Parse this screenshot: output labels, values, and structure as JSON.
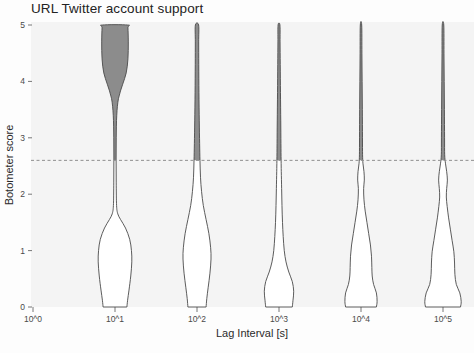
{
  "title": "URL Twitter account support",
  "chart_data": {
    "type": "violin",
    "title": "URL Twitter account support",
    "xlabel": "Lag Interval [s]",
    "ylabel": "Botometer score",
    "grid": false,
    "legend": null,
    "ylim": [
      0,
      5
    ],
    "xlim_log_exponents": [
      0,
      5
    ],
    "y_ticks": [
      "0",
      "1",
      "2",
      "3",
      "4",
      "5"
    ],
    "y_tick_values": [
      0,
      1,
      2,
      3,
      4,
      5
    ],
    "x_ticks": [
      "10^0",
      "10^1",
      "10^2",
      "10^3",
      "10^4",
      "10^5"
    ],
    "x_tick_exponents": [
      0,
      1,
      2,
      3,
      4,
      5
    ],
    "threshold": {
      "value": 2.6,
      "style": "dashed",
      "color": "#8f8f8f",
      "label": "bot threshold"
    },
    "colors": {
      "fill_above_threshold": "#8c8c8c",
      "fill_below_threshold": "#ffffff",
      "outline": "#4a4a4a",
      "panel_background": "#f4f4f4",
      "text": "#2b2b2b"
    },
    "categories": [
      "10^1",
      "10^2",
      "10^3",
      "10^4",
      "10^5"
    ],
    "series": [
      {
        "name": "10^1",
        "center_exponent": 1,
        "kde": [
          {
            "y": 0.0,
            "w": 0.34
          },
          {
            "y": 0.12,
            "w": 0.36
          },
          {
            "y": 0.3,
            "w": 0.4
          },
          {
            "y": 0.55,
            "w": 0.45
          },
          {
            "y": 0.8,
            "w": 0.48
          },
          {
            "y": 1.0,
            "w": 0.47
          },
          {
            "y": 1.2,
            "w": 0.42
          },
          {
            "y": 1.4,
            "w": 0.3
          },
          {
            "y": 1.55,
            "w": 0.16
          },
          {
            "y": 1.65,
            "w": 0.08
          },
          {
            "y": 1.8,
            "w": 0.045
          },
          {
            "y": 2.2,
            "w": 0.035
          },
          {
            "y": 2.6,
            "w": 0.032
          },
          {
            "y": 3.0,
            "w": 0.035
          },
          {
            "y": 3.4,
            "w": 0.05
          },
          {
            "y": 3.7,
            "w": 0.1
          },
          {
            "y": 3.95,
            "w": 0.22
          },
          {
            "y": 4.15,
            "w": 0.32
          },
          {
            "y": 4.4,
            "w": 0.37
          },
          {
            "y": 4.7,
            "w": 0.38
          },
          {
            "y": 4.95,
            "w": 0.37
          },
          {
            "y": 5.0,
            "w": 0.36
          }
        ]
      },
      {
        "name": "10^2",
        "center_exponent": 2,
        "kde": [
          {
            "y": 0.0,
            "w": 0.26
          },
          {
            "y": 0.15,
            "w": 0.28
          },
          {
            "y": 0.35,
            "w": 0.32
          },
          {
            "y": 0.6,
            "w": 0.37
          },
          {
            "y": 0.85,
            "w": 0.4
          },
          {
            "y": 1.05,
            "w": 0.39
          },
          {
            "y": 1.3,
            "w": 0.34
          },
          {
            "y": 1.55,
            "w": 0.26
          },
          {
            "y": 1.8,
            "w": 0.18
          },
          {
            "y": 2.05,
            "w": 0.13
          },
          {
            "y": 2.3,
            "w": 0.1
          },
          {
            "y": 2.6,
            "w": 0.085
          },
          {
            "y": 2.9,
            "w": 0.075
          },
          {
            "y": 3.3,
            "w": 0.065
          },
          {
            "y": 3.8,
            "w": 0.055
          },
          {
            "y": 4.3,
            "w": 0.05
          },
          {
            "y": 4.7,
            "w": 0.048
          },
          {
            "y": 5.0,
            "w": 0.046
          }
        ]
      },
      {
        "name": "10^3",
        "center_exponent": 3,
        "kde": [
          {
            "y": 0.0,
            "w": 0.38
          },
          {
            "y": 0.12,
            "w": 0.4
          },
          {
            "y": 0.28,
            "w": 0.42
          },
          {
            "y": 0.45,
            "w": 0.38
          },
          {
            "y": 0.62,
            "w": 0.28
          },
          {
            "y": 0.8,
            "w": 0.2
          },
          {
            "y": 1.0,
            "w": 0.15
          },
          {
            "y": 1.25,
            "w": 0.12
          },
          {
            "y": 1.5,
            "w": 0.1
          },
          {
            "y": 1.8,
            "w": 0.085
          },
          {
            "y": 2.1,
            "w": 0.075
          },
          {
            "y": 2.4,
            "w": 0.065
          },
          {
            "y": 2.6,
            "w": 0.06
          },
          {
            "y": 2.9,
            "w": 0.055
          },
          {
            "y": 3.3,
            "w": 0.05
          },
          {
            "y": 3.8,
            "w": 0.042
          },
          {
            "y": 4.3,
            "w": 0.035
          },
          {
            "y": 4.7,
            "w": 0.03
          },
          {
            "y": 5.0,
            "w": 0.026
          }
        ]
      },
      {
        "name": "10^4",
        "center_exponent": 4,
        "kde": [
          {
            "y": 0.0,
            "w": 0.44
          },
          {
            "y": 0.1,
            "w": 0.46
          },
          {
            "y": 0.25,
            "w": 0.44
          },
          {
            "y": 0.4,
            "w": 0.36
          },
          {
            "y": 0.55,
            "w": 0.32
          },
          {
            "y": 0.7,
            "w": 0.31
          },
          {
            "y": 0.9,
            "w": 0.3
          },
          {
            "y": 1.1,
            "w": 0.27
          },
          {
            "y": 1.3,
            "w": 0.22
          },
          {
            "y": 1.5,
            "w": 0.17
          },
          {
            "y": 1.7,
            "w": 0.12
          },
          {
            "y": 1.9,
            "w": 0.085
          },
          {
            "y": 2.1,
            "w": 0.075
          },
          {
            "y": 2.25,
            "w": 0.095
          },
          {
            "y": 2.4,
            "w": 0.085
          },
          {
            "y": 2.55,
            "w": 0.055
          },
          {
            "y": 2.7,
            "w": 0.045
          },
          {
            "y": 3.0,
            "w": 0.042
          },
          {
            "y": 3.5,
            "w": 0.038
          },
          {
            "y": 4.0,
            "w": 0.032
          },
          {
            "y": 4.5,
            "w": 0.026
          },
          {
            "y": 5.0,
            "w": 0.02
          }
        ]
      },
      {
        "name": "10^5",
        "center_exponent": 5,
        "kde": [
          {
            "y": 0.0,
            "w": 0.5
          },
          {
            "y": 0.1,
            "w": 0.52
          },
          {
            "y": 0.25,
            "w": 0.48
          },
          {
            "y": 0.4,
            "w": 0.38
          },
          {
            "y": 0.58,
            "w": 0.34
          },
          {
            "y": 0.78,
            "w": 0.33
          },
          {
            "y": 0.98,
            "w": 0.31
          },
          {
            "y": 1.18,
            "w": 0.26
          },
          {
            "y": 1.38,
            "w": 0.21
          },
          {
            "y": 1.58,
            "w": 0.16
          },
          {
            "y": 1.78,
            "w": 0.12
          },
          {
            "y": 1.95,
            "w": 0.095
          },
          {
            "y": 2.1,
            "w": 0.105
          },
          {
            "y": 2.25,
            "w": 0.125
          },
          {
            "y": 2.4,
            "w": 0.105
          },
          {
            "y": 2.55,
            "w": 0.07
          },
          {
            "y": 2.7,
            "w": 0.048
          },
          {
            "y": 3.0,
            "w": 0.045
          },
          {
            "y": 3.5,
            "w": 0.04
          },
          {
            "y": 4.0,
            "w": 0.034
          },
          {
            "y": 4.5,
            "w": 0.028
          },
          {
            "y": 5.0,
            "w": 0.022
          }
        ]
      }
    ]
  }
}
